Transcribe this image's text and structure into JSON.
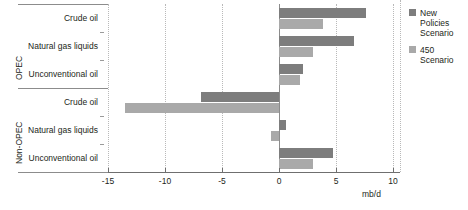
{
  "legend": {
    "items": [
      {
        "label": "New Policies Scenario",
        "color": "#7d7d7d",
        "name": "new-policies-scenario"
      },
      {
        "label": "450 Scenario",
        "color": "#a9a9a9",
        "name": "450-scenario"
      }
    ]
  },
  "axis": {
    "unit": "mb/d",
    "ticks": [
      "-15",
      "-10",
      "-5",
      "0",
      "5",
      "10"
    ]
  },
  "groups": [
    {
      "label": "OPEC"
    },
    {
      "label": "Non-OPEC"
    }
  ],
  "chart_data": {
    "type": "bar",
    "orientation": "horizontal",
    "title": "",
    "xlabel": "mb/d",
    "ylabel": "",
    "xlim": [
      -15,
      10
    ],
    "xticks": [
      -15,
      -10,
      -5,
      0,
      5,
      10
    ],
    "grid": true,
    "legend_position": "right",
    "groups": [
      "OPEC",
      "Non-OPEC"
    ],
    "categories": [
      {
        "group": "OPEC",
        "label": "Crude oil"
      },
      {
        "group": "OPEC",
        "label": "Natural gas liquids"
      },
      {
        "group": "OPEC",
        "label": "Unconventional oil"
      },
      {
        "group": "Non-OPEC",
        "label": "Crude oil"
      },
      {
        "group": "Non-OPEC",
        "label": "Natural gas liquids"
      },
      {
        "group": "Non-OPEC",
        "label": "Unconventional oil"
      }
    ],
    "series": [
      {
        "name": "New Policies Scenario",
        "color": "#7d7d7d",
        "values": [
          7.6,
          6.6,
          2.1,
          -6.8,
          0.6,
          4.7
        ]
      },
      {
        "name": "450 Scenario",
        "color": "#a9a9a9",
        "values": [
          3.9,
          3.0,
          1.8,
          -13.5,
          -0.7,
          3.0
        ]
      }
    ]
  }
}
